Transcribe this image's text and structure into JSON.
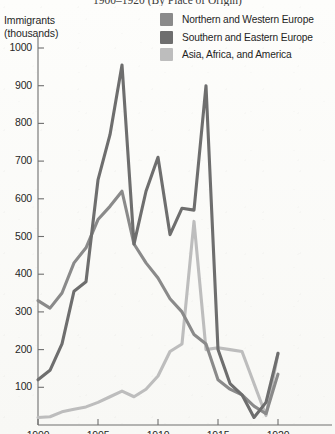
{
  "title": "1900–1920 (By Place of Origin)",
  "axis_title_lines": [
    "Immigrants",
    "(thousands)"
  ],
  "legend": {
    "items": [
      {
        "label": "Northern and Western Europe",
        "color": "#8a8a8a"
      },
      {
        "label": "Southern and Eastern Europe",
        "color": "#6e6e6e"
      },
      {
        "label": "Asia, Africa, and America",
        "color": "#bdbdbd"
      }
    ]
  },
  "yticks": [
    "100",
    "200",
    "300",
    "400",
    "500",
    "600",
    "700",
    "800",
    "900",
    "1000"
  ],
  "xticks": [
    "1900",
    "1905",
    "1910",
    "1915",
    "1920"
  ],
  "chart_data": {
    "type": "line",
    "title": "1900–1920 (By Place of Origin)",
    "xlabel": "",
    "ylabel": "Immigrants (thousands)",
    "xlim": [
      1900,
      1920
    ],
    "ylim": [
      0,
      1030
    ],
    "grid": false,
    "legend_position": "top-right",
    "x": [
      1900,
      1901,
      1902,
      1903,
      1904,
      1905,
      1906,
      1907,
      1908,
      1909,
      1910,
      1911,
      1912,
      1913,
      1914,
      1915,
      1916,
      1917,
      1918,
      1919,
      1920
    ],
    "series": [
      {
        "name": "Northern and Western Europe",
        "color": "#8a8a8a",
        "values": [
          330,
          310,
          350,
          430,
          470,
          545,
          580,
          620,
          480,
          430,
          390,
          335,
          300,
          240,
          215,
          120,
          95,
          80,
          50,
          30,
          135
        ]
      },
      {
        "name": "Southern and Eastern Europe",
        "color": "#6e6e6e",
        "values": [
          120,
          145,
          215,
          355,
          380,
          650,
          770,
          955,
          480,
          620,
          710,
          505,
          575,
          570,
          900,
          200,
          110,
          80,
          20,
          60,
          190
        ]
      },
      {
        "name": "Asia, Africa, and America",
        "color": "#bdbdbd",
        "values": [
          20,
          22,
          35,
          42,
          48,
          60,
          75,
          90,
          75,
          95,
          130,
          195,
          215,
          540,
          200,
          205,
          200,
          195,
          110,
          25,
          190
        ]
      }
    ]
  },
  "geometry": {
    "x0_px": 38,
    "px_per_year": 12.0,
    "y0_px": 425,
    "px_per_100": 37.7
  }
}
